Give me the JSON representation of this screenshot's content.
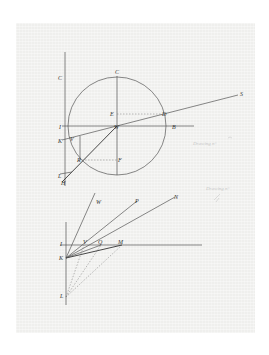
{
  "figure": {
    "paper_color": "#efefed",
    "ink_color": "#444444",
    "upper_diagram": {
      "labels": {
        "C_axis": "C",
        "C_top": "C",
        "E": "E",
        "D": "D",
        "S": "S",
        "I": "I",
        "W": "W",
        "B": "B",
        "K": "K",
        "V": "V",
        "R": "R",
        "F": "F",
        "L": "L",
        "H": "H"
      },
      "circle": {
        "cx": 117,
        "cy": 126,
        "r": 49
      }
    },
    "lower_diagram": {
      "labels": {
        "W": "W",
        "P": "P",
        "N": "N",
        "I": "I",
        "V": "V",
        "Q": "Q",
        "M": "M",
        "K": "K",
        "L": "L"
      }
    },
    "pencil_notes": {
      "note_1": "Drawing n°",
      "note_2": "Drawing n°"
    }
  }
}
